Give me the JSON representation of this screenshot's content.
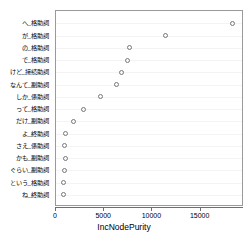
{
  "chart_data": {
    "type": "scatter",
    "title": "",
    "subtitle": "",
    "xlabel": "IncNodePurity",
    "ylabel": "",
    "xlim": [
      0,
      19500
    ],
    "ylim": [
      0,
      16
    ],
    "grid": true,
    "legend": null,
    "xticks": [
      0,
      5000,
      10000,
      15000
    ],
    "xticklabels": [
      "0",
      "5000",
      "10000",
      "15000"
    ],
    "categories": [
      "へ_格助詞",
      "が_格助詞",
      "の_格助詞",
      "で_格助詞",
      "けど_接続助詞",
      "なんて_副助詞",
      "しか_係助詞",
      "って_格助詞",
      "だけ_副助詞",
      "よ_終助詞",
      "さえ_係助詞",
      "かも_副助詞",
      "ぐらい_副助詞",
      "という_格助詞",
      "ね_終助詞"
    ],
    "values": [
      18300,
      11400,
      7600,
      7400,
      6800,
      6300,
      4600,
      2850,
      1800,
      950,
      850,
      950,
      850,
      750,
      800
    ],
    "point_style": "open-circle",
    "point_color": "#777777"
  },
  "axis": {
    "x_title": "IncNodePurity"
  }
}
